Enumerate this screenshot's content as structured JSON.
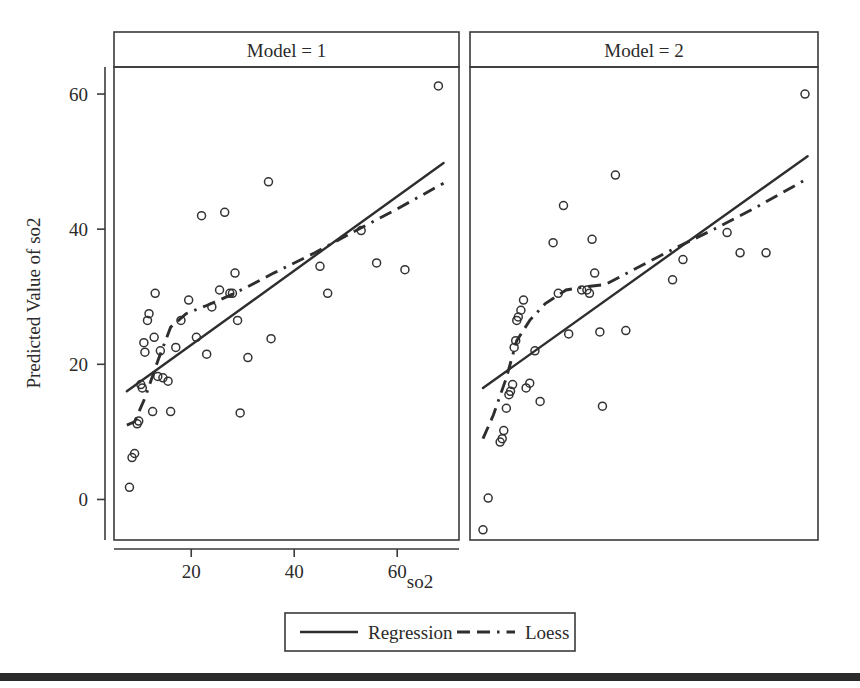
{
  "figure": {
    "background": "#ffffff",
    "line_color": "#2e2e2e",
    "frame_color": "#3a3a3a",
    "footer_bar_color": "#2b2b2b"
  },
  "axis": {
    "x_title": "so2",
    "y_title": "Predicted Value of so2",
    "x_ticks": [
      "20",
      "40",
      "60"
    ],
    "y_ticks": [
      "0",
      "20",
      "40",
      "60"
    ]
  },
  "legend": {
    "items": [
      {
        "label": "Regression",
        "style": "solid"
      },
      {
        "label": "Loess",
        "style": "dash-dot"
      }
    ]
  },
  "panels": [
    {
      "title": "Model = 1"
    },
    {
      "title": "Model = 2"
    }
  ],
  "chart_data": {
    "type": "scatter",
    "title": "",
    "subtitle": "",
    "xlabel": "so2",
    "ylabel": "Predicted Value of so2",
    "xlim": [
      5,
      72
    ],
    "ylim": [
      -6,
      64
    ],
    "x_ticks": [
      20,
      40,
      60
    ],
    "y_ticks": [
      0,
      20,
      40,
      60
    ],
    "grid": false,
    "legend_position": "bottom",
    "facet_variable": "Model",
    "facets": [
      {
        "name": "Model = 1",
        "points": [
          [
            8.0,
            1.8
          ],
          [
            8.5,
            6.2
          ],
          [
            9.0,
            6.8
          ],
          [
            9.5,
            11.2
          ],
          [
            9.8,
            11.6
          ],
          [
            10.2,
            17.0
          ],
          [
            10.5,
            16.5
          ],
          [
            10.8,
            23.2
          ],
          [
            11.0,
            21.8
          ],
          [
            11.5,
            26.5
          ],
          [
            11.8,
            27.5
          ],
          [
            12.5,
            13.0
          ],
          [
            12.8,
            24.0
          ],
          [
            13.0,
            30.5
          ],
          [
            13.5,
            18.2
          ],
          [
            14.0,
            22.0
          ],
          [
            14.5,
            18.0
          ],
          [
            15.5,
            17.5
          ],
          [
            16.0,
            13.0
          ],
          [
            17.0,
            22.5
          ],
          [
            18.0,
            26.5
          ],
          [
            19.5,
            29.5
          ],
          [
            21.0,
            24.0
          ],
          [
            22.0,
            42.0
          ],
          [
            23.0,
            21.5
          ],
          [
            24.0,
            28.5
          ],
          [
            25.5,
            31.0
          ],
          [
            26.5,
            42.5
          ],
          [
            27.5,
            30.5
          ],
          [
            28.0,
            30.5
          ],
          [
            28.5,
            33.5
          ],
          [
            29.0,
            26.5
          ],
          [
            29.5,
            12.8
          ],
          [
            31.0,
            21.0
          ],
          [
            35.0,
            47.0
          ],
          [
            35.5,
            23.8
          ],
          [
            45.0,
            34.5
          ],
          [
            46.5,
            30.5
          ],
          [
            53.0,
            39.8
          ],
          [
            56.0,
            35.0
          ],
          [
            61.5,
            34.0
          ],
          [
            68.0,
            61.2
          ]
        ],
        "regression_line": {
          "x": [
            7.5,
            69.0
          ],
          "y": [
            16.0,
            49.8
          ]
        },
        "loess_line": {
          "x": [
            7.5,
            9.0,
            11.0,
            13.5,
            16.0,
            19.0,
            23.0,
            27.5,
            31.0,
            36.0,
            44.0,
            52.0,
            60.0,
            69.0
          ],
          "y": [
            11.0,
            11.5,
            15.0,
            20.5,
            25.5,
            27.5,
            28.7,
            30.2,
            31.5,
            33.5,
            36.5,
            39.8,
            43.0,
            46.8
          ]
        }
      },
      {
        "name": "Model = 2",
        "points": [
          [
            7.5,
            -4.5
          ],
          [
            8.5,
            0.2
          ],
          [
            10.8,
            8.5
          ],
          [
            11.2,
            9.0
          ],
          [
            11.5,
            10.2
          ],
          [
            12.0,
            13.5
          ],
          [
            12.5,
            15.5
          ],
          [
            12.8,
            16.0
          ],
          [
            13.2,
            17.0
          ],
          [
            13.5,
            22.5
          ],
          [
            13.8,
            23.5
          ],
          [
            14.0,
            26.5
          ],
          [
            14.3,
            27.0
          ],
          [
            14.8,
            28.0
          ],
          [
            15.3,
            29.5
          ],
          [
            15.8,
            16.5
          ],
          [
            16.5,
            17.2
          ],
          [
            17.5,
            22.0
          ],
          [
            18.5,
            14.5
          ],
          [
            21.0,
            38.0
          ],
          [
            22.0,
            30.5
          ],
          [
            23.0,
            43.5
          ],
          [
            24.0,
            24.5
          ],
          [
            26.5,
            31.0
          ],
          [
            27.5,
            31.0
          ],
          [
            28.0,
            30.5
          ],
          [
            28.5,
            38.5
          ],
          [
            29.0,
            33.5
          ],
          [
            30.0,
            24.8
          ],
          [
            30.5,
            13.8
          ],
          [
            33.0,
            48.0
          ],
          [
            35.0,
            25.0
          ],
          [
            44.0,
            32.5
          ],
          [
            46.0,
            35.5
          ],
          [
            54.5,
            39.5
          ],
          [
            57.0,
            36.5
          ],
          [
            62.0,
            36.5
          ],
          [
            69.5,
            60.0
          ]
        ],
        "regression_line": {
          "x": [
            7.5,
            70.0
          ],
          "y": [
            16.5,
            50.8
          ]
        },
        "loess_line": {
          "x": [
            7.5,
            9.5,
            12.0,
            14.0,
            16.5,
            19.5,
            23.5,
            27.5,
            31.0,
            36.0,
            44.0,
            52.0,
            60.0,
            70.0
          ],
          "y": [
            9.0,
            12.5,
            18.0,
            23.5,
            26.5,
            29.0,
            31.0,
            31.5,
            31.8,
            33.8,
            37.0,
            40.0,
            43.2,
            47.5
          ]
        }
      }
    ]
  }
}
